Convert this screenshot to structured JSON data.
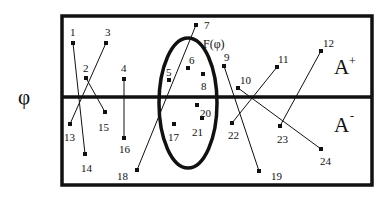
{
  "diagram": {
    "axis_symbol": "φ",
    "function_label": "F(φ)",
    "regions": [
      {
        "id": "upper",
        "label": "A",
        "sup": "+"
      },
      {
        "id": "lower",
        "label": "A",
        "sup": "-"
      }
    ],
    "colors": {
      "ink": "#111111",
      "background": "#ffffff"
    },
    "points": [
      {
        "id": "1",
        "x": 73,
        "y": 43,
        "lx": 70,
        "ly": 36
      },
      {
        "id": "2",
        "x": 86,
        "y": 78,
        "lx": 83,
        "ly": 72
      },
      {
        "id": "3",
        "x": 106,
        "y": 43,
        "lx": 105,
        "ly": 36
      },
      {
        "id": "4",
        "x": 124,
        "y": 79,
        "lx": 121,
        "ly": 72
      },
      {
        "id": "5",
        "x": 169,
        "y": 80,
        "lx": 166,
        "ly": 76
      },
      {
        "id": "6",
        "x": 188,
        "y": 68,
        "lx": 189,
        "ly": 64
      },
      {
        "id": "7",
        "x": 196,
        "y": 25,
        "lx": 204,
        "ly": 29
      },
      {
        "id": "8",
        "x": 203,
        "y": 74,
        "lx": 201,
        "ly": 90
      },
      {
        "id": "9",
        "x": 224,
        "y": 66,
        "lx": 224,
        "ly": 61
      },
      {
        "id": "10",
        "x": 238,
        "y": 88,
        "lx": 240,
        "ly": 84
      },
      {
        "id": "11",
        "x": 277,
        "y": 67,
        "lx": 278,
        "ly": 63
      },
      {
        "id": "12",
        "x": 321,
        "y": 51,
        "lx": 323,
        "ly": 47
      },
      {
        "id": "13",
        "x": 70,
        "y": 124,
        "lx": 64,
        "ly": 141
      },
      {
        "id": "14",
        "x": 85,
        "y": 154,
        "lx": 81,
        "ly": 172
      },
      {
        "id": "15",
        "x": 105,
        "y": 112,
        "lx": 98,
        "ly": 131
      },
      {
        "id": "16",
        "x": 124,
        "y": 138,
        "lx": 119,
        "ly": 153
      },
      {
        "id": "17",
        "x": 174,
        "y": 124,
        "lx": 168,
        "ly": 141
      },
      {
        "id": "18",
        "x": 137,
        "y": 170,
        "lx": 117,
        "ly": 180
      },
      {
        "id": "19",
        "x": 259,
        "y": 171,
        "lx": 271,
        "ly": 180
      },
      {
        "id": "20",
        "x": 197,
        "y": 105,
        "lx": 200,
        "ly": 117
      },
      {
        "id": "21",
        "x": 202,
        "y": 118,
        "lx": 192,
        "ly": 136
      },
      {
        "id": "22",
        "x": 232,
        "y": 123,
        "lx": 228,
        "ly": 139
      },
      {
        "id": "23",
        "x": 280,
        "y": 126,
        "lx": 277,
        "ly": 143
      },
      {
        "id": "24",
        "x": 321,
        "y": 149,
        "lx": 320,
        "ly": 165
      }
    ],
    "links": [
      [
        "1",
        "14"
      ],
      [
        "3",
        "13"
      ],
      [
        "2",
        "15"
      ],
      [
        "4",
        "16"
      ],
      [
        "7",
        "18"
      ],
      [
        "9",
        "19"
      ],
      [
        "10",
        "24"
      ],
      [
        "11",
        "22"
      ],
      [
        "12",
        "23"
      ]
    ]
  }
}
